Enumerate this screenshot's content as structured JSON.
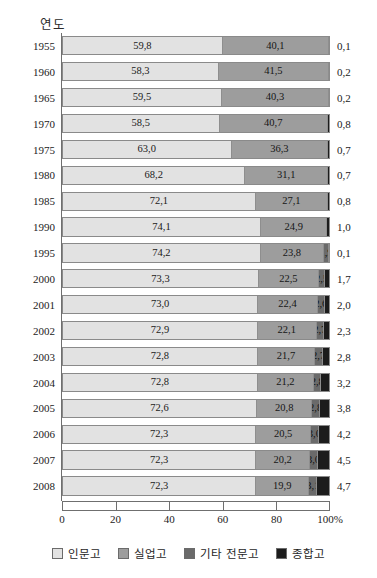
{
  "chart_data": {
    "type": "bar",
    "subtype": "horizontal-100-percent-stacked",
    "title": "",
    "xlabel": "",
    "ylabel": "연도",
    "xlim": [
      0,
      100
    ],
    "xticks": [
      0,
      20,
      40,
      60,
      80,
      100
    ],
    "xtick_labels": [
      "0",
      "20",
      "40",
      "60",
      "80",
      "100%"
    ],
    "grid": false,
    "legend_position": "bottom",
    "categories": [
      "1955",
      "1960",
      "1965",
      "1970",
      "1975",
      "1980",
      "1985",
      "1990",
      "1995",
      "2000",
      "2001",
      "2002",
      "2003",
      "2004",
      "2005",
      "2006",
      "2007",
      "2008"
    ],
    "series": [
      {
        "name": "인문고",
        "color": "#e2e2e2",
        "values": [
          59.8,
          58.3,
          59.5,
          58.5,
          63.0,
          68.2,
          72.1,
          74.1,
          74.2,
          73.3,
          73.0,
          72.9,
          72.8,
          72.8,
          72.6,
          72.3,
          72.3,
          72.3
        ]
      },
      {
        "name": "실업고",
        "color": "#9d9d9d",
        "values": [
          40.1,
          41.5,
          40.3,
          40.7,
          36.3,
          31.1,
          27.1,
          24.9,
          23.8,
          22.5,
          22.4,
          22.1,
          21.7,
          21.2,
          20.8,
          20.5,
          20.2,
          19.9
        ]
      },
      {
        "name": "기타 전문고",
        "color": "#6a6a6a",
        "values": [
          0,
          0,
          0,
          0,
          0,
          0,
          0,
          0,
          1.9,
          2.5,
          2.6,
          2.7,
          2.7,
          2.8,
          2.8,
          3.0,
          3.0,
          3.1
        ]
      },
      {
        "name": "종합고",
        "color": "#1c1c1c",
        "values": [
          0.1,
          0.2,
          0.2,
          0.8,
          0.7,
          0.7,
          0.8,
          1.0,
          0.1,
          1.7,
          2.0,
          2.3,
          2.8,
          3.2,
          3.8,
          4.2,
          4.5,
          4.7
        ]
      }
    ],
    "rows": [
      {
        "year": "1955",
        "segments": [
          {
            "series": "인문고",
            "value": 59.8,
            "label": "59,8",
            "show_label": true
          },
          {
            "series": "실업고",
            "value": 40.1,
            "label": "40,1",
            "show_label": true
          },
          {
            "series": "기타 전문고",
            "value": 0,
            "label": "",
            "show_label": false
          },
          {
            "series": "종합고",
            "value": 0.1,
            "label": "",
            "show_label": false
          }
        ],
        "outer_value": "0,1"
      },
      {
        "year": "1960",
        "segments": [
          {
            "series": "인문고",
            "value": 58.3,
            "label": "58,3",
            "show_label": true
          },
          {
            "series": "실업고",
            "value": 41.5,
            "label": "41,5",
            "show_label": true
          },
          {
            "series": "기타 전문고",
            "value": 0,
            "label": "",
            "show_label": false
          },
          {
            "series": "종합고",
            "value": 0.2,
            "label": "",
            "show_label": false
          }
        ],
        "outer_value": "0,2"
      },
      {
        "year": "1965",
        "segments": [
          {
            "series": "인문고",
            "value": 59.5,
            "label": "59,5",
            "show_label": true
          },
          {
            "series": "실업고",
            "value": 40.3,
            "label": "40,3",
            "show_label": true
          },
          {
            "series": "기타 전문고",
            "value": 0,
            "label": "",
            "show_label": false
          },
          {
            "series": "종합고",
            "value": 0.2,
            "label": "",
            "show_label": false
          }
        ],
        "outer_value": "0,2"
      },
      {
        "year": "1970",
        "segments": [
          {
            "series": "인문고",
            "value": 58.5,
            "label": "58,5",
            "show_label": true
          },
          {
            "series": "실업고",
            "value": 40.7,
            "label": "40,7",
            "show_label": true
          },
          {
            "series": "기타 전문고",
            "value": 0,
            "label": "",
            "show_label": false
          },
          {
            "series": "종합고",
            "value": 0.8,
            "label": "",
            "show_label": false
          }
        ],
        "outer_value": "0,8"
      },
      {
        "year": "1975",
        "segments": [
          {
            "series": "인문고",
            "value": 63.0,
            "label": "63,0",
            "show_label": true
          },
          {
            "series": "실업고",
            "value": 36.3,
            "label": "36,3",
            "show_label": true
          },
          {
            "series": "기타 전문고",
            "value": 0,
            "label": "",
            "show_label": false
          },
          {
            "series": "종합고",
            "value": 0.7,
            "label": "",
            "show_label": false
          }
        ],
        "outer_value": "0,7"
      },
      {
        "year": "1980",
        "segments": [
          {
            "series": "인문고",
            "value": 68.2,
            "label": "68,2",
            "show_label": true
          },
          {
            "series": "실업고",
            "value": 31.1,
            "label": "31,1",
            "show_label": true
          },
          {
            "series": "기타 전문고",
            "value": 0,
            "label": "",
            "show_label": false
          },
          {
            "series": "종합고",
            "value": 0.7,
            "label": "",
            "show_label": false
          }
        ],
        "outer_value": "0,7"
      },
      {
        "year": "1985",
        "segments": [
          {
            "series": "인문고",
            "value": 72.1,
            "label": "72,1",
            "show_label": true
          },
          {
            "series": "실업고",
            "value": 27.1,
            "label": "27,1",
            "show_label": true
          },
          {
            "series": "기타 전문고",
            "value": 0,
            "label": "",
            "show_label": false
          },
          {
            "series": "종합고",
            "value": 0.8,
            "label": "",
            "show_label": false
          }
        ],
        "outer_value": "0,8"
      },
      {
        "year": "1990",
        "segments": [
          {
            "series": "인문고",
            "value": 74.1,
            "label": "74,1",
            "show_label": true
          },
          {
            "series": "실업고",
            "value": 24.9,
            "label": "24,9",
            "show_label": true
          },
          {
            "series": "기타 전문고",
            "value": 0,
            "label": "",
            "show_label": false
          },
          {
            "series": "종합고",
            "value": 1.0,
            "label": "",
            "show_label": false
          }
        ],
        "outer_value": "1,0"
      },
      {
        "year": "1995",
        "segments": [
          {
            "series": "인문고",
            "value": 74.2,
            "label": "74,2",
            "show_label": true
          },
          {
            "series": "실업고",
            "value": 23.8,
            "label": "23,8",
            "show_label": true
          },
          {
            "series": "기타 전문고",
            "value": 1.9,
            "label": "1,9",
            "show_label": true
          },
          {
            "series": "종합고",
            "value": 0.1,
            "label": "",
            "show_label": false
          }
        ],
        "outer_value": "0,1"
      },
      {
        "year": "2000",
        "segments": [
          {
            "series": "인문고",
            "value": 73.3,
            "label": "73,3",
            "show_label": true
          },
          {
            "series": "실업고",
            "value": 22.5,
            "label": "22,5",
            "show_label": true
          },
          {
            "series": "기타 전문고",
            "value": 2.5,
            "label": "2,5",
            "show_label": true
          },
          {
            "series": "종합고",
            "value": 1.7,
            "label": "",
            "show_label": false
          }
        ],
        "outer_value": "1,7"
      },
      {
        "year": "2001",
        "segments": [
          {
            "series": "인문고",
            "value": 73.0,
            "label": "73,0",
            "show_label": true
          },
          {
            "series": "실업고",
            "value": 22.4,
            "label": "22,4",
            "show_label": true
          },
          {
            "series": "기타 전문고",
            "value": 2.6,
            "label": "2,6",
            "show_label": true
          },
          {
            "series": "종합고",
            "value": 2.0,
            "label": "",
            "show_label": false
          }
        ],
        "outer_value": "2,0"
      },
      {
        "year": "2002",
        "segments": [
          {
            "series": "인문고",
            "value": 72.9,
            "label": "72,9",
            "show_label": true
          },
          {
            "series": "실업고",
            "value": 22.1,
            "label": "22,1",
            "show_label": true
          },
          {
            "series": "기타 전문고",
            "value": 2.7,
            "label": "2,7",
            "show_label": true
          },
          {
            "series": "종합고",
            "value": 2.3,
            "label": "",
            "show_label": false
          }
        ],
        "outer_value": "2,3"
      },
      {
        "year": "2003",
        "segments": [
          {
            "series": "인문고",
            "value": 72.8,
            "label": "72,8",
            "show_label": true
          },
          {
            "series": "실업고",
            "value": 21.7,
            "label": "21,7",
            "show_label": true
          },
          {
            "series": "기타 전문고",
            "value": 2.7,
            "label": "2,7",
            "show_label": true
          },
          {
            "series": "종합고",
            "value": 2.8,
            "label": "",
            "show_label": false
          }
        ],
        "outer_value": "2,8"
      },
      {
        "year": "2004",
        "segments": [
          {
            "series": "인문고",
            "value": 72.8,
            "label": "72,8",
            "show_label": true
          },
          {
            "series": "실업고",
            "value": 21.2,
            "label": "21,2",
            "show_label": true
          },
          {
            "series": "기타 전문고",
            "value": 2.8,
            "label": "2,8",
            "show_label": true
          },
          {
            "series": "종합고",
            "value": 3.2,
            "label": "",
            "show_label": false
          }
        ],
        "outer_value": "3,2"
      },
      {
        "year": "2005",
        "segments": [
          {
            "series": "인문고",
            "value": 72.6,
            "label": "72,6",
            "show_label": true
          },
          {
            "series": "실업고",
            "value": 20.8,
            "label": "20,8",
            "show_label": true
          },
          {
            "series": "기타 전문고",
            "value": 2.8,
            "label": "2,8",
            "show_label": true
          },
          {
            "series": "종합고",
            "value": 3.8,
            "label": "",
            "show_label": false
          }
        ],
        "outer_value": "3,8"
      },
      {
        "year": "2006",
        "segments": [
          {
            "series": "인문고",
            "value": 72.3,
            "label": "72,3",
            "show_label": true
          },
          {
            "series": "실업고",
            "value": 20.5,
            "label": "20,5",
            "show_label": true
          },
          {
            "series": "기타 전문고",
            "value": 3.0,
            "label": "3,0",
            "show_label": true
          },
          {
            "series": "종합고",
            "value": 4.2,
            "label": "",
            "show_label": false
          }
        ],
        "outer_value": "4,2"
      },
      {
        "year": "2007",
        "segments": [
          {
            "series": "인문고",
            "value": 72.3,
            "label": "72,3",
            "show_label": true
          },
          {
            "series": "실업고",
            "value": 20.2,
            "label": "20,2",
            "show_label": true
          },
          {
            "series": "기타 전문고",
            "value": 3.0,
            "label": "3,0",
            "show_label": true
          },
          {
            "series": "종합고",
            "value": 4.5,
            "label": "",
            "show_label": false
          }
        ],
        "outer_value": "4,5"
      },
      {
        "year": "2008",
        "segments": [
          {
            "series": "인문고",
            "value": 72.3,
            "label": "72,3",
            "show_label": true
          },
          {
            "series": "실업고",
            "value": 19.9,
            "label": "19,9",
            "show_label": true
          },
          {
            "series": "기타 전문고",
            "value": 3.1,
            "label": "3,1",
            "show_label": true
          },
          {
            "series": "종합고",
            "value": 4.7,
            "label": "",
            "show_label": false
          }
        ],
        "outer_value": "4,7"
      }
    ],
    "legend": [
      {
        "label": "인문고",
        "color": "#e2e2e2"
      },
      {
        "label": "실업고",
        "color": "#9d9d9d"
      },
      {
        "label": "기타 전문고",
        "color": "#6a6a6a"
      },
      {
        "label": "종합고",
        "color": "#1c1c1c"
      }
    ]
  }
}
